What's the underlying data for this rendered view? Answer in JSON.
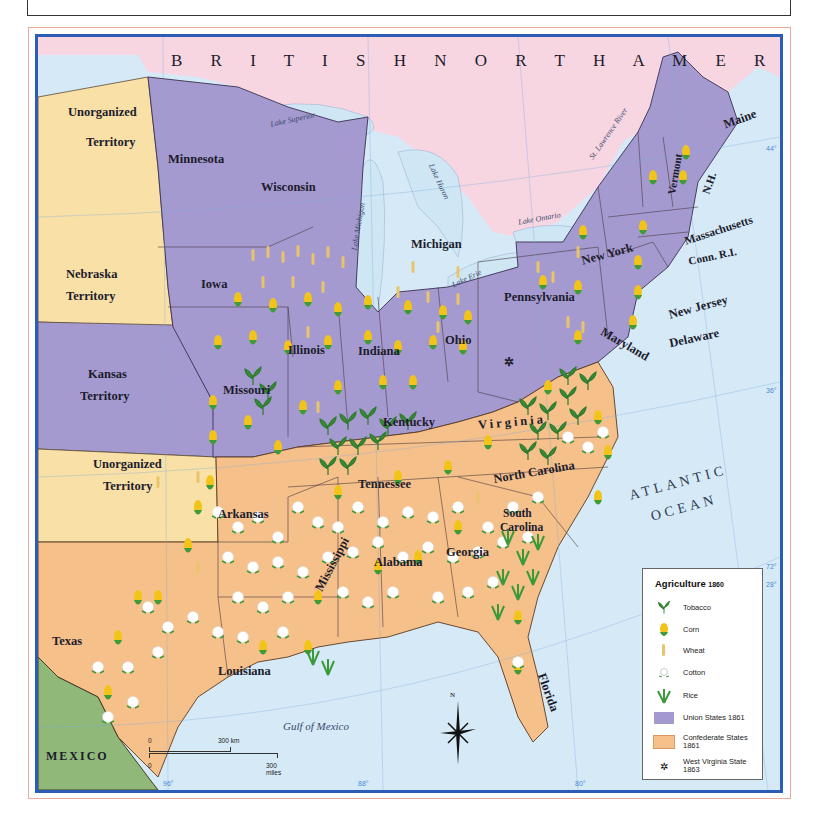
{
  "map": {
    "title": "Agriculture 1860",
    "regions": {
      "british_north_america": "B R I T I S H   N O R T H   A M E R I C A",
      "mexico": "MEXICO",
      "atlantic_1": "ATLANTIC",
      "atlantic_2": "OCEAN",
      "gulf": "Gulf of Mexico"
    },
    "territories": {
      "unorganized_north_1": "Unorganized",
      "unorganized_north_2": "Territory",
      "nebraska_1": "Nebraska",
      "nebraska_2": "Territory",
      "kansas_1": "Kansas",
      "kansas_2": "Territory",
      "unorganized_south_1": "Unorganized",
      "unorganized_south_2": "Territory"
    },
    "states": {
      "minnesota": "Minnesota",
      "wisconsin": "Wisconsin",
      "michigan": "Michigan",
      "iowa": "Iowa",
      "illinois": "Illinois",
      "indiana": "Indiana",
      "ohio": "Ohio",
      "missouri": "Missouri",
      "kentucky": "Kentucky",
      "pennsylvania": "Pennsylvania",
      "new_york": "New York",
      "vermont": "Vermont",
      "nh": "N.H.",
      "maine": "Maine",
      "massachusetts": "Massachusetts",
      "conn_ri": "Conn. R.I.",
      "new_jersey": "New Jersey",
      "delaware": "Delaware",
      "maryland": "Maryland",
      "virginia": "Virginia",
      "north_carolina": "North Carolina",
      "south_carolina_1": "South",
      "south_carolina_2": "Carolina",
      "tennessee": "Tennessee",
      "arkansas": "Arkansas",
      "texas": "Texas",
      "louisiana": "Louisiana",
      "mississippi": "Mississippi",
      "alabama": "Alabama",
      "georgia": "Georgia",
      "florida": "Florida"
    },
    "water": {
      "lake_superior": "Lake Superior",
      "lake_michigan": "Lake Michigan",
      "lake_huron": "Lake Huron",
      "lake_erie": "Lake Erie",
      "lake_ontario": "Lake Ontario",
      "st_lawrence": "St. Lawrence River"
    },
    "graticule": {
      "lat_44": "44°",
      "lat_36": "36°",
      "lat_28": "28°",
      "lon_96": "96°",
      "lon_88": "88°",
      "lon_80": "80°",
      "lon_72": "72°"
    },
    "scale": {
      "km_zero": "0",
      "km_label": "300 km",
      "mi_zero": "0",
      "mi_label": "300 miles"
    },
    "compass": {
      "north": "N"
    }
  },
  "legend": {
    "title": "Agriculture",
    "year": "1860",
    "items": [
      {
        "icon": "tobacco-icon",
        "label": "Tobacco"
      },
      {
        "icon": "corn-icon",
        "label": "Corn"
      },
      {
        "icon": "wheat-icon",
        "label": "Wheat"
      },
      {
        "icon": "cotton-icon",
        "label": "Cotton"
      },
      {
        "icon": "rice-icon",
        "label": "Rice"
      },
      {
        "icon": "union-swatch",
        "label": "Union States 1861",
        "color": "#a59ad0"
      },
      {
        "icon": "confederate-swatch",
        "label": "Confederate States 1861",
        "color": "#f6c08a"
      },
      {
        "icon": "west-virginia-icon",
        "label": "West Virginia State 1863"
      }
    ]
  },
  "colors": {
    "union": "#a59ad0",
    "confederate": "#f6c08a",
    "territory": "#f9e0a6",
    "canada": "#f7d6e2",
    "mexico": "#8fb879",
    "water": "#d6e9f7",
    "border": "#2b5cb8"
  }
}
